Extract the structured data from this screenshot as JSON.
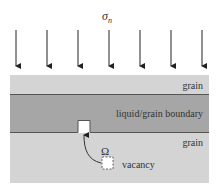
{
  "stress": {
    "symbol": "σ",
    "subscript": "n",
    "arrow_count": 7
  },
  "layers": {
    "top_grain": {
      "label": "grain",
      "color": "#d4d4d4"
    },
    "boundary": {
      "label": "liquid/grain boundary",
      "color": "#a6a6a6"
    },
    "bottom_grain": {
      "label": "grain",
      "color": "#d4d4d4"
    }
  },
  "vacancy": {
    "symbol": "Ω",
    "label": "vacancy"
  }
}
